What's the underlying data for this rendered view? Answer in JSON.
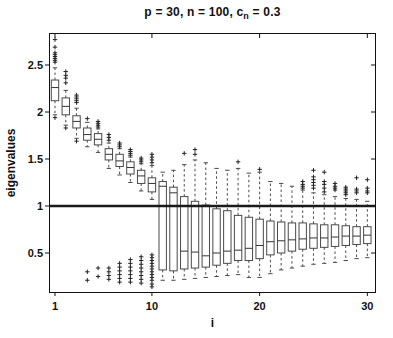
{
  "title": {
    "prefix": "p = 30, n = 100, c",
    "sub": "n",
    "suffix": " = 0.3"
  },
  "axes": {
    "x_label": "i",
    "y_label": "eigenvalues"
  },
  "colors": {
    "background": "#ffffff",
    "ink": "#111111",
    "box_stroke": "#4a4a4a",
    "reference_line": "#1a1a1a"
  },
  "chart_data": {
    "type": "boxplot",
    "xlabel": "i",
    "ylabel": "eigenvalues",
    "x_ticks": [
      1,
      10,
      20,
      30
    ],
    "y_ticks": [
      0.5,
      1,
      1.5,
      2,
      2.5
    ],
    "xlim": [
      0.45,
      30.8
    ],
    "ylim": [
      0.07,
      2.85
    ],
    "grid": false,
    "legend": false,
    "reference_line_y": 1,
    "boxes": [
      {
        "i": 1,
        "q1": 2.12,
        "median": 2.26,
        "q3": 2.34,
        "whisker_low": 1.97,
        "whisker_high": 2.47,
        "outliers_high": [
          2.53,
          2.55,
          2.57,
          2.59,
          2.61,
          2.63,
          2.69,
          2.77
        ],
        "outliers_low": [
          1.94
        ]
      },
      {
        "i": 2,
        "q1": 1.97,
        "median": 2.06,
        "q3": 2.15,
        "whisker_low": 1.86,
        "whisker_high": 2.23,
        "outliers_high": [
          2.31,
          2.36,
          2.39,
          2.43
        ],
        "outliers_low": [
          1.83
        ]
      },
      {
        "i": 3,
        "q1": 1.83,
        "median": 1.9,
        "q3": 1.96,
        "whisker_low": 1.72,
        "whisker_high": 2.04,
        "outliers_high": [
          2.1,
          2.12,
          2.14,
          2.16,
          2.18
        ],
        "outliers_low": [
          1.69
        ]
      },
      {
        "i": 4,
        "q1": 1.7,
        "median": 1.76,
        "q3": 1.83,
        "whisker_low": 1.63,
        "whisker_high": 1.89,
        "outliers_high": [
          1.93
        ],
        "outliers_low": [
          0.3,
          0.21
        ]
      },
      {
        "i": 5,
        "q1": 1.65,
        "median": 1.71,
        "q3": 1.77,
        "whisker_low": 1.57,
        "whisker_high": 1.82,
        "outliers_high": [
          1.84,
          1.86,
          1.88,
          1.9
        ],
        "outliers_low": [
          0.34,
          0.25
        ]
      },
      {
        "i": 6,
        "q1": 1.49,
        "median": 1.55,
        "q3": 1.61,
        "whisker_low": 1.4,
        "whisker_high": 1.67,
        "outliers_high": [
          1.7,
          1.73,
          1.76
        ],
        "outliers_low": [
          0.34,
          0.3,
          0.26,
          0.22
        ]
      },
      {
        "i": 7,
        "q1": 1.42,
        "median": 1.48,
        "q3": 1.55,
        "whisker_low": 1.33,
        "whisker_high": 1.61,
        "outliers_high": [
          1.63,
          1.65,
          1.67
        ],
        "outliers_low": [
          0.39,
          0.35,
          0.31,
          0.27,
          0.23,
          0.19
        ]
      },
      {
        "i": 8,
        "q1": 1.34,
        "median": 1.41,
        "q3": 1.47,
        "whisker_low": 1.25,
        "whisker_high": 1.52,
        "outliers_high": [
          1.54,
          1.56,
          1.58,
          1.6
        ],
        "outliers_low": [
          0.43,
          0.39,
          0.35,
          0.31,
          0.27,
          0.23,
          0.19
        ]
      },
      {
        "i": 9,
        "q1": 1.24,
        "median": 1.32,
        "q3": 1.38,
        "whisker_low": 1.16,
        "whisker_high": 1.45,
        "outliers_high": [
          1.47,
          1.49,
          1.51
        ],
        "outliers_low": [
          0.46,
          0.42,
          0.38,
          0.34,
          0.3,
          0.26,
          0.22,
          0.18
        ]
      },
      {
        "i": 10,
        "q1": 1.15,
        "median": 1.24,
        "q3": 1.3,
        "whisker_low": 1.07,
        "whisker_high": 1.43,
        "outliers_high": [
          1.46,
          1.49,
          1.52,
          1.55
        ],
        "outliers_low": [
          0.48,
          0.45,
          0.42,
          0.39,
          0.36,
          0.33,
          0.3,
          0.27,
          0.24,
          0.21,
          0.17,
          0.14
        ]
      },
      {
        "i": 11,
        "q1": 0.32,
        "median": 1.21,
        "q3": 1.26,
        "whisker_low": 0.21,
        "whisker_high": 1.36,
        "outliers_high": [],
        "outliers_low": []
      },
      {
        "i": 12,
        "q1": 0.31,
        "median": 1.14,
        "q3": 1.2,
        "whisker_low": 0.21,
        "whisker_high": 1.38,
        "outliers_high": [],
        "outliers_low": []
      },
      {
        "i": 13,
        "q1": 0.33,
        "median": 0.52,
        "q3": 1.1,
        "whisker_low": 0.22,
        "whisker_high": 1.44,
        "outliers_high": [
          1.56
        ],
        "outliers_low": []
      },
      {
        "i": 14,
        "q1": 0.34,
        "median": 0.51,
        "q3": 1.05,
        "whisker_low": 0.23,
        "whisker_high": 1.49,
        "outliers_high": [
          1.55,
          1.6
        ],
        "outliers_low": []
      },
      {
        "i": 15,
        "q1": 0.35,
        "median": 0.47,
        "q3": 1.01,
        "whisker_low": 0.24,
        "whisker_high": 1.46,
        "outliers_high": [],
        "outliers_low": []
      },
      {
        "i": 16,
        "q1": 0.37,
        "median": 0.5,
        "q3": 0.97,
        "whisker_low": 0.25,
        "whisker_high": 1.4,
        "outliers_high": [],
        "outliers_low": []
      },
      {
        "i": 17,
        "q1": 0.39,
        "median": 0.52,
        "q3": 0.95,
        "whisker_low": 0.26,
        "whisker_high": 1.38,
        "outliers_high": [],
        "outliers_low": []
      },
      {
        "i": 18,
        "q1": 0.42,
        "median": 0.53,
        "q3": 0.9,
        "whisker_low": 0.27,
        "whisker_high": 1.4,
        "outliers_high": [
          1.47
        ],
        "outliers_low": []
      },
      {
        "i": 19,
        "q1": 0.42,
        "median": 0.55,
        "q3": 0.88,
        "whisker_low": 0.24,
        "whisker_high": 1.35,
        "outliers_high": [],
        "outliers_low": []
      },
      {
        "i": 20,
        "q1": 0.44,
        "median": 0.58,
        "q3": 0.86,
        "whisker_low": 0.24,
        "whisker_high": 1.36,
        "outliers_high": [
          1.39
        ],
        "outliers_low": []
      },
      {
        "i": 21,
        "q1": 0.48,
        "median": 0.62,
        "q3": 0.84,
        "whisker_low": 0.28,
        "whisker_high": 1.26,
        "outliers_high": [],
        "outliers_low": []
      },
      {
        "i": 22,
        "q1": 0.5,
        "median": 0.63,
        "q3": 0.83,
        "whisker_low": 0.32,
        "whisker_high": 1.24,
        "outliers_high": [],
        "outliers_low": []
      },
      {
        "i": 23,
        "q1": 0.52,
        "median": 0.64,
        "q3": 0.82,
        "whisker_low": 0.34,
        "whisker_high": 1.21,
        "outliers_high": [],
        "outliers_low": []
      },
      {
        "i": 24,
        "q1": 0.54,
        "median": 0.65,
        "q3": 0.82,
        "whisker_low": 0.36,
        "whisker_high": 1.17,
        "outliers_high": [
          1.19,
          1.21,
          1.23,
          1.26
        ],
        "outliers_low": []
      },
      {
        "i": 25,
        "q1": 0.55,
        "median": 0.66,
        "q3": 0.81,
        "whisker_low": 0.38,
        "whisker_high": 1.14,
        "outliers_high": [
          1.19,
          1.22,
          1.25,
          1.28,
          1.31,
          1.38
        ],
        "outliers_low": []
      },
      {
        "i": 26,
        "q1": 0.56,
        "median": 0.66,
        "q3": 0.8,
        "whisker_low": 0.39,
        "whisker_high": 1.12,
        "outliers_high": [
          1.15,
          1.19,
          1.23,
          1.26,
          1.36
        ],
        "outliers_low": []
      },
      {
        "i": 27,
        "q1": 0.57,
        "median": 0.67,
        "q3": 0.8,
        "whisker_low": 0.4,
        "whisker_high": 1.1,
        "outliers_high": [
          1.17,
          1.19,
          1.21,
          1.24
        ],
        "outliers_low": []
      },
      {
        "i": 28,
        "q1": 0.58,
        "median": 0.68,
        "q3": 0.79,
        "whisker_low": 0.42,
        "whisker_high": 1.08,
        "outliers_high": [
          1.12,
          1.14,
          1.16,
          1.18,
          1.2
        ],
        "outliers_low": []
      },
      {
        "i": 29,
        "q1": 0.59,
        "median": 0.68,
        "q3": 0.78,
        "whisker_low": 0.44,
        "whisker_high": 1.07,
        "outliers_high": [
          1.14,
          1.16,
          1.18,
          1.3
        ],
        "outliers_low": []
      },
      {
        "i": 30,
        "q1": 0.6,
        "median": 0.69,
        "q3": 0.78,
        "whisker_low": 0.45,
        "whisker_high": 1.05,
        "outliers_high": [
          1.14,
          1.16,
          1.19,
          1.28
        ],
        "outliers_low": []
      }
    ]
  }
}
